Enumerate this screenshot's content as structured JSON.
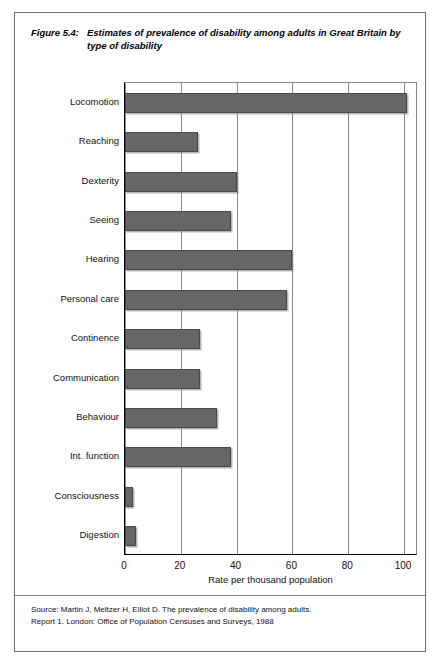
{
  "figure": {
    "label": "Figure 5.4:",
    "title": "Estimates of prevalence of disability among adults in Great Britain by type of disability",
    "source_line1": "Source: Martin J, Meltzer H, Elliot D. The prevalence of disability among adults.",
    "source_line2": "Report 1. London: Office of Population Censuses and Surveys, 1988"
  },
  "chart_data": {
    "type": "bar",
    "orientation": "horizontal",
    "title": "Estimates of prevalence of disability among adults in Great Britain by type of disability",
    "xlabel": "Rate per thousand population",
    "ylabel": "",
    "xlim": [
      0,
      105
    ],
    "xticks": [
      0,
      20,
      40,
      60,
      80,
      100
    ],
    "xtick_labels": [
      "0",
      "20",
      "40",
      "60",
      "80",
      "100"
    ],
    "grid": "vertical",
    "legend": "none",
    "bar_color": "#666666",
    "categories": [
      "Locomotion",
      "Reaching",
      "Dexterity",
      "Seeing",
      "Hearing",
      "Personal care",
      "Continence",
      "Communication",
      "Behaviour",
      "Int. function",
      "Consciousness",
      "Digestion"
    ],
    "values": [
      101,
      26,
      40,
      38,
      60,
      58,
      27,
      27,
      33,
      38,
      3,
      4
    ]
  }
}
